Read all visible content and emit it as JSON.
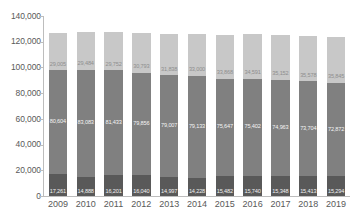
{
  "chart_data": {
    "type": "bar",
    "stacked": true,
    "title": "",
    "subtitle": "",
    "xlabel": "",
    "ylabel": "",
    "ylim": [
      0,
      140000
    ],
    "ytick_labels": [
      "0",
      "20,000",
      "40,000",
      "60,000",
      "80,000",
      "100,000",
      "120,000",
      "140,000"
    ],
    "ytick_values": [
      0,
      20000,
      40000,
      60000,
      80000,
      100000,
      120000,
      140000
    ],
    "grid": false,
    "legend": "none",
    "categories": [
      "2009",
      "2010",
      "2011",
      "2012",
      "2013",
      "2014",
      "2015",
      "2016",
      "2017",
      "2018",
      "2019"
    ],
    "series": [
      {
        "name": "bottom",
        "color": "#595959",
        "values": [
          17261,
          14888,
          16201,
          16040,
          14997,
          14228,
          15482,
          15740,
          15348,
          15413,
          15294
        ],
        "labels": [
          "17,261",
          "14,888",
          "16,201",
          "16,040",
          "14,997",
          "14,228",
          "15,482",
          "15,740",
          "15,348",
          "15,413",
          "15,294"
        ]
      },
      {
        "name": "middle",
        "color": "#808080",
        "values": [
          80604,
          83083,
          81433,
          79856,
          79007,
          79133,
          75647,
          75402,
          74963,
          73704,
          72872
        ],
        "labels": [
          "80,604",
          "83,083",
          "81,433",
          "79,856",
          "79,007",
          "79,133",
          "75,647",
          "75,402",
          "74,963",
          "73,704",
          "72,872"
        ]
      },
      {
        "name": "top",
        "color": "#c8c8c8",
        "values": [
          29005,
          29484,
          29752,
          30793,
          31838,
          33000,
          33868,
          34591,
          35152,
          35578,
          35845
        ],
        "labels": [
          "29,005",
          "29,484",
          "29,752",
          "30,793",
          "31,838",
          "33,000",
          "33,868",
          "34,591",
          "35,152",
          "35,578",
          "35,845"
        ]
      }
    ],
    "totals": [
      126870,
      127455,
      127386,
      126689,
      125842,
      126361,
      124997,
      125733,
      125463,
      124695,
      124011
    ]
  },
  "colors": {
    "bottom": "#595959",
    "middle": "#808080",
    "top": "#c8c8c8",
    "axis": "#bdbdbd",
    "tick_text": "#595959",
    "background": "#ffffff"
  }
}
